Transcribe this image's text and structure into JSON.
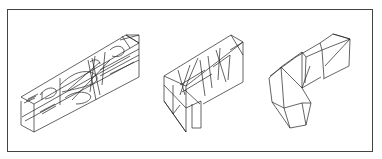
{
  "figure": {
    "panels": [
      {
        "name": "elongated-box-with-internal-curves",
        "label": ""
      },
      {
        "name": "l-shaped-box-with-triangulation",
        "label": ""
      },
      {
        "name": "simplified-l-shaped-polyhedron",
        "label": ""
      }
    ],
    "colors": {
      "line": "#222222",
      "frame": "#444444",
      "background": "#ffffff"
    }
  }
}
